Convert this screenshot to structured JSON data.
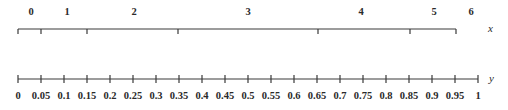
{
  "x_axis": {
    "name": "x",
    "line": {
      "x1": 18,
      "x2": 456,
      "y": 29
    },
    "ticks_px": [
      18,
      41,
      87,
      178,
      318,
      410,
      456
    ],
    "segment_labels": [
      {
        "text": "0",
        "x": 31
      },
      {
        "text": "1",
        "x": 67
      },
      {
        "text": "2",
        "x": 134
      },
      {
        "text": "3",
        "x": 248
      },
      {
        "text": "4",
        "x": 361
      },
      {
        "text": "5",
        "x": 434
      },
      {
        "text": "6",
        "x": 471
      }
    ],
    "name_pos": {
      "x": 488,
      "y": 22
    }
  },
  "y_axis": {
    "name": "y",
    "line": {
      "x1": 18,
      "x2": 478,
      "y": 79
    },
    "tick_start_px": 18,
    "tick_step_px": 23,
    "labels": [
      "0",
      "0.05",
      "0.1",
      "0.15",
      "0.2",
      "0.25",
      "0.3",
      "0.35",
      "0.4",
      "0.45",
      "0.5",
      "0.55",
      "0.6",
      "0.65",
      "0.7",
      "0.75",
      "0.8",
      "0.85",
      "0.9",
      "0.95",
      "1"
    ],
    "name_pos": {
      "x": 489,
      "y": 72
    }
  },
  "colors": {
    "line": "#3a3a3a",
    "text": "#2a2a2a",
    "background": "#ffffff"
  }
}
